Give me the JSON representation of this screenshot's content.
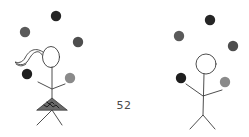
{
  "game": {
    "score": "52"
  },
  "colors": {
    "ball_dark": "#262626",
    "ball_black": "#1e1e1e",
    "ball_gray": "#5a5a5a",
    "ball_mid": "#4e4e4e",
    "ball_light": "#8a8a8a",
    "line": "#3a3a3a",
    "skirt": "#555555"
  },
  "figures": [
    {
      "name": "left-juggler",
      "balls": [
        {
          "cx": 56,
          "cy": 16,
          "shade": "dark"
        },
        {
          "cx": 25,
          "cy": 32,
          "shade": "gray"
        },
        {
          "cx": 78,
          "cy": 42,
          "shade": "mid"
        },
        {
          "cx": 27,
          "cy": 74,
          "shade": "black"
        },
        {
          "cx": 70,
          "cy": 78,
          "shade": "light"
        }
      ]
    },
    {
      "name": "right-juggler",
      "balls": [
        {
          "cx": 210,
          "cy": 20,
          "shade": "dark"
        },
        {
          "cx": 179,
          "cy": 36,
          "shade": "gray"
        },
        {
          "cx": 233,
          "cy": 46,
          "shade": "mid"
        },
        {
          "cx": 181,
          "cy": 78,
          "shade": "black"
        },
        {
          "cx": 225,
          "cy": 82,
          "shade": "light"
        }
      ]
    }
  ]
}
